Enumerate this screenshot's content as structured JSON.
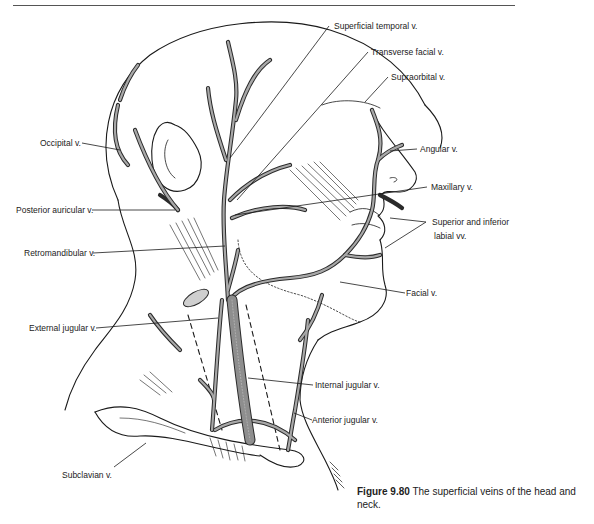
{
  "figure": {
    "number": "Figure 9.80",
    "caption": "The superficial veins of the head and neck.",
    "colors": {
      "line": "#1a1a1a",
      "vein_fill": "#9a9a9a",
      "vein_stroke": "#2a2a2a",
      "background": "#ffffff"
    }
  },
  "labels": {
    "superficial_temporal": "Superficial temporal v.",
    "transverse_facial": "Transverse facial v.",
    "supraorbital": "Supraorbital v.",
    "angular": "Angular v.",
    "maxillary": "Maxillary v.",
    "labial_line1": "Superior and inferior",
    "labial_line2": "labial vv.",
    "facial": "Facial v.",
    "occipital": "Occipital v.",
    "posterior_auricular": "Posterior auricular v.",
    "retromandibular": "Retromandibular v.",
    "external_jugular": "External jugular v.",
    "internal_jugular": "Internal jugular v.",
    "anterior_jugular": "Anterior jugular v.",
    "subclavian": "Subclavian v."
  }
}
